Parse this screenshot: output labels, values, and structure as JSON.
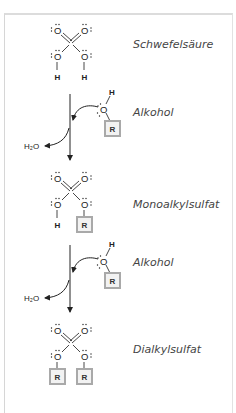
{
  "diagram": {
    "title": "",
    "steps": [
      {
        "kind": "molecule",
        "name": "Schwefelsäure",
        "label": "Schwefelsäure",
        "atoms": {
          "top_left": "O",
          "top_right": "O",
          "bottom_left": "O",
          "bottom_right": "O",
          "sub_left": "H",
          "sub_right": "H"
        }
      },
      {
        "kind": "reaction",
        "reagent_label": "Alkohol",
        "reagent": {
          "o": "O",
          "h": "H",
          "r": "R"
        },
        "byproduct": "H₂O"
      },
      {
        "kind": "molecule",
        "name": "Monoalkylsulfat",
        "label": "Monoalkylsulfat",
        "atoms": {
          "top_left": "O",
          "top_right": "O",
          "bottom_left": "O",
          "bottom_right": "O",
          "sub_left": "H",
          "sub_right": "R"
        }
      },
      {
        "kind": "reaction",
        "reagent_label": "Alkohol",
        "reagent": {
          "o": "O",
          "h": "H",
          "r": "R"
        },
        "byproduct": "H₂O"
      },
      {
        "kind": "molecule",
        "name": "Dialkylsulfat",
        "label": "Dialkylsulfat",
        "atoms": {
          "top_left": "O",
          "top_right": "O",
          "bottom_left": "O",
          "bottom_right": "O",
          "sub_left": "R",
          "sub_right": "R"
        }
      }
    ],
    "colors": {
      "frame": "#dcdcdc",
      "r_box_fill": "#f2f2f2",
      "r_box_border": "#a9a9a9",
      "label_text": "#444444"
    }
  }
}
